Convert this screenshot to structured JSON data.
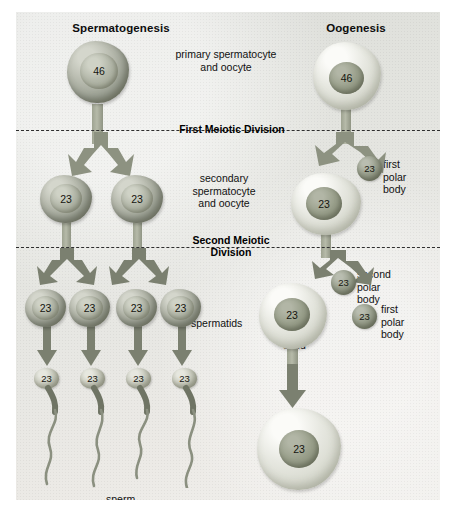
{
  "diagram": {
    "title_left": "Spermatogenesis",
    "title_right": "Oogenesis",
    "stages": {
      "primary": "primary spermatocyte\nand oocyte",
      "secondary": "secondary\nspermatocyte\nand oocyte",
      "spermatids": "spermatids",
      "sperm": "sperm",
      "ootid": "ootid",
      "egg": "egg",
      "first_polar_body": "first\npolar\nbody",
      "second_polar_body": "second\npolar\nbody"
    },
    "divisions": {
      "first": "First Meiotic Division",
      "second": "Second Meiotic\nDivision"
    },
    "chromosome_counts": {
      "diploid": "46",
      "haploid": "23"
    },
    "colors": {
      "background": "#e5e6e1",
      "male_cell": "#9ba093",
      "female_cell": "#d9dbd0",
      "nucleus": "#8f9480",
      "arrow": "#8d9281",
      "dashed_line": "#2e2e2e",
      "text": "#111111"
    },
    "cells": {
      "primary_spermatocyte": {
        "label": "46",
        "type": "male"
      },
      "primary_oocyte": {
        "label": "46",
        "type": "female"
      },
      "secondary_spermatocytes": [
        "23",
        "23"
      ],
      "secondary_oocyte": "23",
      "first_polar_body_after_meiosis1": "23",
      "spermatid_row": [
        "23",
        "23",
        "23",
        "23"
      ],
      "sperm_row": [
        "23",
        "23",
        "23",
        "23"
      ],
      "ootid": "23",
      "polar_bodies_meiosis2": [
        "23",
        "23"
      ],
      "egg": "23"
    }
  }
}
